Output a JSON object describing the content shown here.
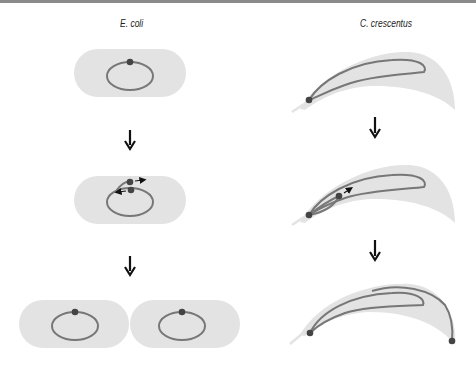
{
  "titles": {
    "left": "E. coli",
    "right": "C. crescentus"
  },
  "colors": {
    "cell_fill": "#e3e3e3",
    "chromosome": "#777777",
    "origin_dot": "#444444",
    "arrow": "#111111"
  },
  "panels": {
    "ecoli": [
      "single-cell-one-origin",
      "replicating-two-origins-moving-apart",
      "two-daughter-cells"
    ],
    "ccrescentus": [
      "cell-origin-at-pole",
      "replicating-origin-moving",
      "two-origins-at-opposite-poles"
    ]
  }
}
